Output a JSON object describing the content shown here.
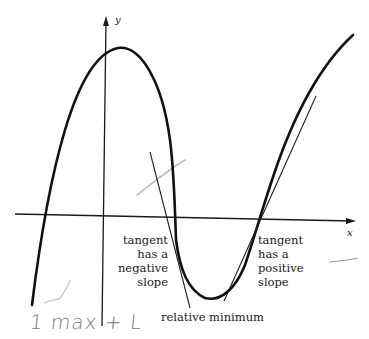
{
  "diagram": {
    "type": "function-graph",
    "axes": {
      "x_label": "x",
      "y_label": "y"
    },
    "annotations": {
      "negative_tangent": {
        "lines": [
          "tangent",
          "has a",
          "negative",
          "slope"
        ]
      },
      "positive_tangent": {
        "lines": [
          "tangent",
          "has a",
          "positive",
          "slope"
        ]
      },
      "minimum_label": "relative minimum"
    },
    "handwritten_note": "1 max + L",
    "colors": {
      "curve": "#111111",
      "axis": "#1a1a1a",
      "tangent": "#222222",
      "pencil": "#b8b8b8",
      "handwriting": "#7a7a7a"
    }
  }
}
